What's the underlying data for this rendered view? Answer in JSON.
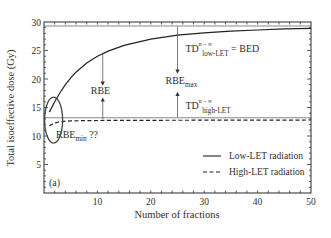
{
  "chart_data": {
    "type": "line",
    "title": "",
    "panel_label": "(a)",
    "xlabel": "Number of fractions",
    "ylabel": "Total isoeffective dose (Gy)",
    "xlim": [
      0,
      50
    ],
    "ylim": [
      0,
      30
    ],
    "x_ticks": [
      10,
      20,
      30,
      40,
      50
    ],
    "y_ticks": [
      5,
      10,
      15,
      20,
      25,
      30
    ],
    "grid": false,
    "legend_position": "lower right",
    "series": [
      {
        "name": "Low-LET radiation",
        "style": "solid",
        "x": [
          1,
          2,
          3,
          4,
          5,
          6,
          8,
          10,
          12,
          15,
          20,
          25,
          30,
          35,
          40,
          45,
          50
        ],
        "values": [
          14.2,
          16.0,
          17.6,
          19.0,
          20.2,
          21.2,
          22.8,
          24.0,
          24.9,
          25.9,
          27.0,
          27.7,
          28.1,
          28.4,
          28.6,
          28.8,
          28.9
        ]
      },
      {
        "name": "High-LET radiation",
        "style": "dashed",
        "x": [
          1,
          2,
          3,
          4,
          5,
          8,
          10,
          20,
          30,
          40,
          50
        ],
        "values": [
          11.8,
          12.3,
          12.5,
          12.6,
          12.65,
          12.7,
          12.72,
          12.75,
          12.77,
          12.78,
          12.8
        ]
      }
    ],
    "reference_lines": [
      {
        "name": "asymptote-low-LET",
        "y": 29.3,
        "style": "solid-thin"
      },
      {
        "name": "asymptote-high-LET",
        "y": 13.2,
        "style": "solid-thin"
      }
    ],
    "annotations": [
      {
        "text": "RBE",
        "x": 11,
        "y": 17.5,
        "arrow": "between curves at n≈11"
      },
      {
        "text": "RBE",
        "sub": "max",
        "x": 25,
        "y": 19.5,
        "arrow": "between asymptotes at n≈25"
      },
      {
        "text": "TD",
        "sub": "low-LET",
        "sup": "n→∞",
        "suffix": " = BED",
        "x": 26,
        "y": 24.5
      },
      {
        "text": "TD",
        "sub": "high-LET",
        "sup": "n→∞",
        "x": 26,
        "y": 14.5
      },
      {
        "text": "RBE",
        "sub": "min",
        "suffix": " ??",
        "x": 4,
        "y": 9.5,
        "note": "ellipse around low-n region"
      }
    ]
  }
}
